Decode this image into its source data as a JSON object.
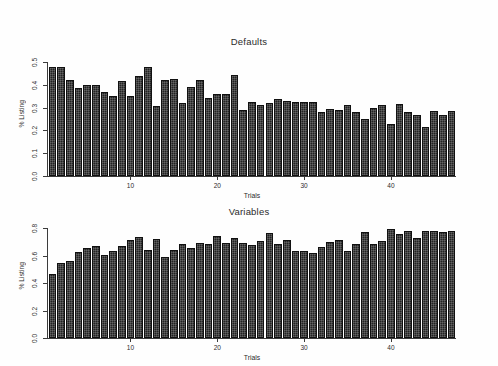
{
  "figure": {
    "background": "#ffffff",
    "bar_color": "#232323",
    "axis_color": "#3c3c3c",
    "text_color": "#2b2b2b"
  },
  "chart_data": [
    {
      "type": "bar",
      "title": "Defaults",
      "xlabel": "Trials",
      "ylabel": "% Listing",
      "ylim": [
        0.0,
        0.5
      ],
      "xlim": [
        0,
        47
      ],
      "grid": false,
      "legend": "none",
      "ytick_labels": [
        "0.0",
        "0.1",
        "0.2",
        "0.3",
        "0.4",
        "0.5"
      ],
      "ytick_values": [
        0.0,
        0.1,
        0.2,
        0.3,
        0.4,
        0.5
      ],
      "xtick_labels": [
        "10",
        "20",
        "30",
        "40"
      ],
      "xtick_values": [
        10,
        20,
        30,
        40
      ],
      "categories": [
        1,
        2,
        3,
        4,
        5,
        6,
        7,
        8,
        9,
        10,
        11,
        12,
        13,
        14,
        15,
        16,
        17,
        18,
        19,
        20,
        21,
        22,
        23,
        24,
        25,
        26,
        27,
        28,
        29,
        30,
        31,
        32,
        33,
        34,
        35,
        36,
        37,
        38,
        39,
        40,
        41,
        42,
        43,
        44,
        45,
        46,
        47
      ],
      "values": [
        0.48,
        0.48,
        0.42,
        0.387,
        0.4,
        0.4,
        0.368,
        0.352,
        0.415,
        0.353,
        0.438,
        0.477,
        0.305,
        0.42,
        0.425,
        0.32,
        0.392,
        0.421,
        0.342,
        0.358,
        0.358,
        0.443,
        0.29,
        0.324,
        0.31,
        0.322,
        0.338,
        0.329,
        0.323,
        0.324,
        0.325,
        0.281,
        0.294,
        0.291,
        0.311,
        0.279,
        0.251,
        0.298,
        0.313,
        0.229,
        0.314,
        0.281,
        0.266,
        0.216,
        0.285,
        0.267,
        0.285
      ]
    },
    {
      "type": "bar",
      "title": "Variables",
      "xlabel": "Trials",
      "ylabel": "% Listing",
      "ylim": [
        0.0,
        0.8
      ],
      "xlim": [
        0,
        47
      ],
      "grid": false,
      "legend": "none",
      "ytick_labels": [
        "0.0",
        "0.2",
        "0.4",
        "0.6",
        "0.8"
      ],
      "ytick_values": [
        0.0,
        0.2,
        0.4,
        0.6,
        0.8
      ],
      "xtick_labels": [
        "10",
        "20",
        "30",
        "40"
      ],
      "xtick_values": [
        10,
        20,
        30,
        40
      ],
      "categories": [
        1,
        2,
        3,
        4,
        5,
        6,
        7,
        8,
        9,
        10,
        11,
        12,
        13,
        14,
        15,
        16,
        17,
        18,
        19,
        20,
        21,
        22,
        23,
        24,
        25,
        26,
        27,
        28,
        29,
        30,
        31,
        32,
        33,
        34,
        35,
        36,
        37,
        38,
        39,
        40,
        41,
        42,
        43,
        44,
        45,
        46,
        47
      ],
      "values": [
        0.462,
        0.545,
        0.559,
        0.628,
        0.656,
        0.666,
        0.604,
        0.634,
        0.668,
        0.715,
        0.735,
        0.637,
        0.718,
        0.592,
        0.638,
        0.682,
        0.655,
        0.69,
        0.686,
        0.743,
        0.694,
        0.727,
        0.693,
        0.678,
        0.706,
        0.765,
        0.686,
        0.712,
        0.632,
        0.631,
        0.618,
        0.665,
        0.697,
        0.713,
        0.634,
        0.684,
        0.773,
        0.685,
        0.703,
        0.792,
        0.76,
        0.778,
        0.726,
        0.777,
        0.777,
        0.771,
        0.779
      ]
    }
  ]
}
